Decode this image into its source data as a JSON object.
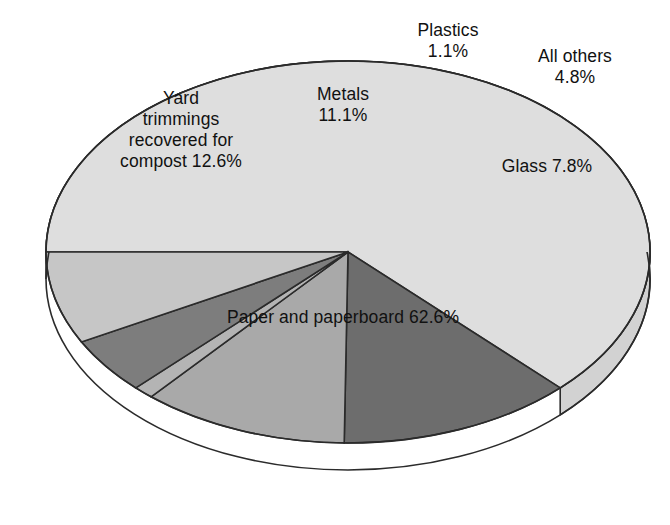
{
  "chart_data": {
    "type": "pie",
    "title": "",
    "subtitle": "",
    "xlabel": "",
    "ylabel": "",
    "legend_position": "none",
    "grid": false,
    "style": "3d-pie",
    "units": "percent",
    "categories": [
      "Paper and paperboard",
      "Yard trimmings recovered for compost",
      "Metals",
      "Plastics",
      "All others",
      "Glass"
    ],
    "values": [
      62.6,
      12.6,
      11.1,
      1.1,
      4.8,
      7.8
    ],
    "slices": [
      {
        "name": "Paper and paperboard",
        "value": 62.6,
        "label": "Paper and paperboard 62.6%",
        "label_lines": [
          "Paper and paperboard 62.6%"
        ],
        "color": "#dedede"
      },
      {
        "name": "Yard trimmings recovered for compost",
        "value": 12.6,
        "label": "Yard trimmings recovered for compost 12.6%",
        "label_lines": [
          "Yard",
          "trimmings",
          "recovered for",
          "compost 12.6%"
        ],
        "color": "#6d6d6d"
      },
      {
        "name": "Metals",
        "value": 11.1,
        "label": "Metals 11.1%",
        "label_lines": [
          "Metals",
          "11.1%"
        ],
        "color": "#a9a9a9"
      },
      {
        "name": "Plastics",
        "value": 1.1,
        "label": "Plastics 1.1%",
        "label_lines": [
          "Plastics",
          "1.1%"
        ],
        "color": "#b4b4b4"
      },
      {
        "name": "All others",
        "value": 4.8,
        "label": "All others 4.8%",
        "label_lines": [
          "All others",
          "4.8%"
        ],
        "color": "#7d7d7d"
      },
      {
        "name": "Glass",
        "value": 7.8,
        "label": "Glass 7.8%",
        "label_lines": [
          "Glass 7.8%"
        ],
        "color": "#c6c6c6"
      }
    ]
  },
  "labels": {
    "plastics_line1": "Plastics",
    "plastics_line2": "1.1%",
    "allothers_line1": "All others",
    "allothers_line2": "4.8%",
    "metals_line1": "Metals",
    "metals_line2": "11.1%",
    "yard_line1": "Yard",
    "yard_line2": "trimmings",
    "yard_line3": "recovered for",
    "yard_line4": "compost 12.6%",
    "glass": "Glass 7.8%",
    "paper": "Paper and paperboard 62.6%"
  },
  "colors": {
    "background": "#ffffff",
    "outline": "#2b2b2b",
    "paper": "#dedede",
    "paper_side": "#d2d2d2",
    "yard": "#6d6d6d",
    "metals": "#a9a9a9",
    "plastics": "#b4b4b4",
    "all_others": "#7d7d7d",
    "glass": "#c6c6c6",
    "text": "#111111"
  }
}
